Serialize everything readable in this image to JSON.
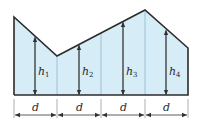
{
  "diagram": {
    "type": "trapezoidal-area-figure",
    "colors": {
      "fill": "#d6ecf6",
      "outline": "#2b2b2b",
      "divider": "#9cc3d6",
      "arrow": "#333333"
    },
    "heights": [
      {
        "symbol": "h",
        "subscript": "1"
      },
      {
        "symbol": "h",
        "subscript": "2"
      },
      {
        "symbol": "h",
        "subscript": "3"
      },
      {
        "symbol": "h",
        "subscript": "4"
      }
    ],
    "spacings": [
      {
        "label": "d"
      },
      {
        "label": "d"
      },
      {
        "label": "d"
      },
      {
        "label": "d"
      }
    ]
  }
}
